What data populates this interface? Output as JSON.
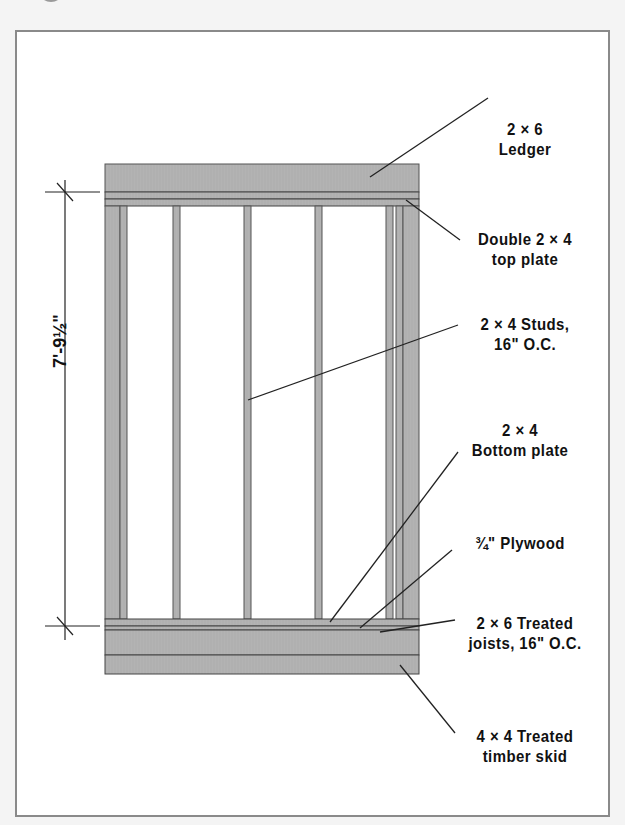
{
  "diagram": {
    "dimension": {
      "height_label": "7'-9½\""
    },
    "labels": [
      {
        "id": "ledger",
        "line1": "2 × 6",
        "line2": "Ledger"
      },
      {
        "id": "top-plate",
        "line1": "Double 2 × 4",
        "line2": "top plate"
      },
      {
        "id": "studs",
        "line1": "2 × 4 Studs,",
        "line2": "16\" O.C."
      },
      {
        "id": "bottom-plate",
        "line1": "2 × 4",
        "line2": "Bottom plate"
      },
      {
        "id": "plywood",
        "line1": "¾\" Plywood",
        "line2": ""
      },
      {
        "id": "joists",
        "line1": "2 × 6 Treated",
        "line2": "joists, 16\" O.C."
      },
      {
        "id": "skid",
        "line1": "4 × 4 Treated",
        "line2": "timber skid"
      }
    ],
    "colors": {
      "lumber_fill": "#b3b3b3",
      "lumber_stroke": "#4a4a4a",
      "leader_line": "#222222",
      "panel_border": "#8a8a8a",
      "background": "#ffffff"
    }
  }
}
